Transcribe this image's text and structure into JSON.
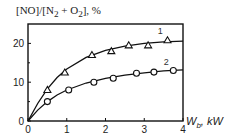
{
  "chart_data": {
    "type": "line",
    "title": "",
    "ylabel": "[NO]/[N2 + O2], %",
    "ylabel_parts": {
      "main": "[NO]/[N",
      "sub1": "2",
      "mid": " + O",
      "sub2": "2",
      "end": "], %"
    },
    "xlabel": "W_b, kW",
    "xlabel_parts": {
      "main": "W",
      "sub": "b",
      "end": ", kW"
    },
    "xlim": [
      0,
      4
    ],
    "ylim": [
      0,
      25
    ],
    "xticks": [
      0,
      1,
      2,
      3,
      4
    ],
    "yticks": [
      0,
      10,
      20
    ],
    "ytick_minor": [
      5,
      15
    ],
    "grid": false,
    "legend": "inline labels",
    "series": [
      {
        "name": "1",
        "marker": "triangle",
        "x": [
          0.5,
          0.95,
          1.65,
          2.15,
          2.6,
          3.1,
          3.6
        ],
        "y": [
          8.0,
          12.5,
          17.0,
          18.0,
          19.5,
          19.5,
          20.8
        ],
        "fit_curve": [
          [
            0,
            0
          ],
          [
            0.25,
            4.5
          ],
          [
            0.5,
            8.3
          ],
          [
            0.75,
            11.2
          ],
          [
            1,
            13.4
          ],
          [
            1.5,
            16.4
          ],
          [
            2,
            18.2
          ],
          [
            2.5,
            19.3
          ],
          [
            3,
            20.0
          ],
          [
            3.5,
            20.4
          ],
          [
            4,
            20.6
          ]
        ]
      },
      {
        "name": "2",
        "marker": "circle",
        "x": [
          0.5,
          1.05,
          1.7,
          2.2,
          2.8,
          3.25,
          3.75
        ],
        "y": [
          5.0,
          8.0,
          10.0,
          11.0,
          12.3,
          12.6,
          13.0
        ],
        "fit_curve": [
          [
            0,
            0
          ],
          [
            0.25,
            2.8
          ],
          [
            0.5,
            5.0
          ],
          [
            0.75,
            6.7
          ],
          [
            1,
            8.0
          ],
          [
            1.5,
            9.8
          ],
          [
            2,
            11.0
          ],
          [
            2.5,
            11.8
          ],
          [
            3,
            12.4
          ],
          [
            3.5,
            12.9
          ],
          [
            4,
            13.2
          ]
        ]
      }
    ]
  }
}
